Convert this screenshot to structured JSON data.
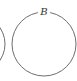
{
  "diagram": {
    "type": "circles",
    "circles": [
      {
        "id": "left-partial",
        "label": "",
        "cx": -24,
        "cy": 44,
        "r": 29,
        "partial": true
      },
      {
        "id": "B",
        "label": "B",
        "cx": 44,
        "cy": 44,
        "r": 32
      }
    ],
    "label_b": "B",
    "stroke_color": "#6e6e6e"
  }
}
